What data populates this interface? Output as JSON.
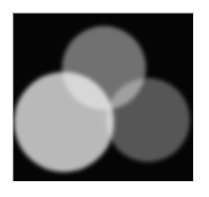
{
  "image": {
    "title": "Additive mixing of three overlapping circles",
    "background_color": "#ffffff",
    "plate_color": "#050505",
    "plate_border_color": "#d8d8d8",
    "blend_mode": "screen",
    "alt_text": "Three overlapping soft-edged circles of differing gray levels on a black square; the overlaps are brighter than the individual circles, with the brightest region where the light circle meets the top circle."
  },
  "chart_data": {
    "type": "scatter",
    "title": "Additive mixing of three overlapping circles",
    "xlabel": "",
    "ylabel": "",
    "xlim": [
      0,
      180
    ],
    "ylim": [
      0,
      168
    ],
    "grid": false,
    "legend": "none",
    "series": [
      {
        "name": "top-circle",
        "label": "Top circle",
        "cx": 91,
        "cy": 55,
        "r": 42,
        "color": "#6e6e6e",
        "gray_level": 110
      },
      {
        "name": "left-circle",
        "label": "Left circle",
        "cx": 51,
        "cy": 109,
        "r": 50,
        "color": "#b8b8b8",
        "gray_level": 184
      },
      {
        "name": "right-circle",
        "label": "Right circle",
        "cx": 135,
        "cy": 107,
        "r": 42,
        "color": "#535353",
        "gray_level": 83
      }
    ],
    "overlaps": [
      {
        "name": "left-and-top",
        "label": "Left + Top overlap",
        "color": "#f0f0f0",
        "gray_level": 240
      },
      {
        "name": "top-and-right",
        "label": "Top + Right overlap",
        "color": "#9a9a9a",
        "gray_level": 154
      },
      {
        "name": "left-and-right",
        "label": "Left + Right overlap",
        "color": "#d4d4d4",
        "gray_level": 212
      }
    ]
  }
}
